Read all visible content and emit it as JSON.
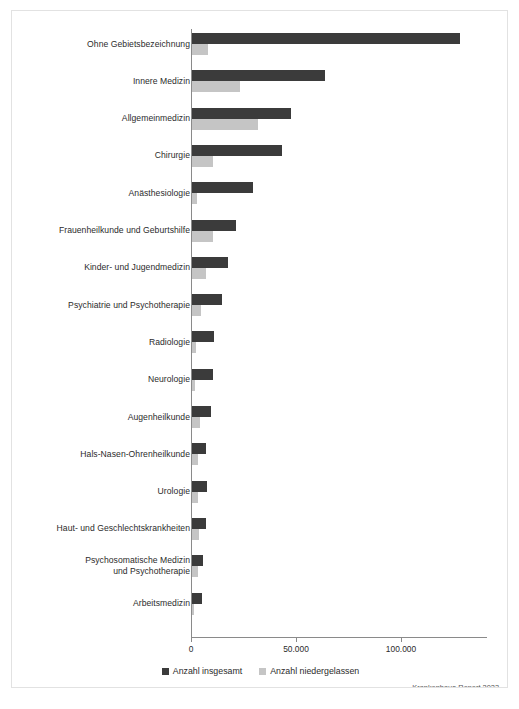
{
  "card": {
    "source_note": "Krankenhaus-Report 2023"
  },
  "legend": {
    "items": [
      {
        "label": "Anzahl insgesamt",
        "color": "#3b3b3b",
        "key": "total"
      },
      {
        "label": "Anzahl niedergelassen",
        "color": "#c5c5c5",
        "key": "nieder"
      }
    ]
  },
  "axis": {
    "ticks": [
      "0",
      "50.000",
      "100.000"
    ],
    "tick_values": [
      0,
      50000,
      100000
    ]
  },
  "chart_data": {
    "type": "bar",
    "orientation": "horizontal",
    "title": "",
    "subtitle": "",
    "xlabel": "",
    "ylabel": "",
    "xlim": [
      0,
      135000
    ],
    "grid": false,
    "legend_position": "bottom",
    "tick_labels": [
      "0",
      "50.000",
      "100.000"
    ],
    "categories": [
      "Ohne Gebietsbezeichnung",
      "Innere Medizin",
      "Allgemeinmedizin",
      "Chirurgie",
      "Anästhesiologie",
      "Frauenheilkunde und Geburtshilfe",
      "Kinder- und Jugendmedizin",
      "Psychiatrie und Psychotherapie",
      "Radiologie",
      "Neurologie",
      "Augenheilkunde",
      "Hals-Nasen-Ohrenheilkunde",
      "Urologie",
      "Haut- und Geschlechtskrankheiten",
      "Psychosomatische Medizin\nund Psychotherapie",
      "Arbeitsmedizin"
    ],
    "series": [
      {
        "name": "Anzahl insgesamt",
        "color": "#3b3b3b",
        "values": [
          127500,
          63500,
          47000,
          43000,
          29000,
          21000,
          17000,
          14500,
          10500,
          10000,
          9000,
          6700,
          7100,
          6800,
          5200,
          4700
        ]
      },
      {
        "name": "Anzahl niedergelassen",
        "color": "#c5c5c5",
        "values": [
          7600,
          23000,
          31500,
          10000,
          2400,
          10000,
          6500,
          4300,
          2000,
          1500,
          4000,
          3000,
          2800,
          3300,
          2900,
          900
        ]
      }
    ]
  }
}
